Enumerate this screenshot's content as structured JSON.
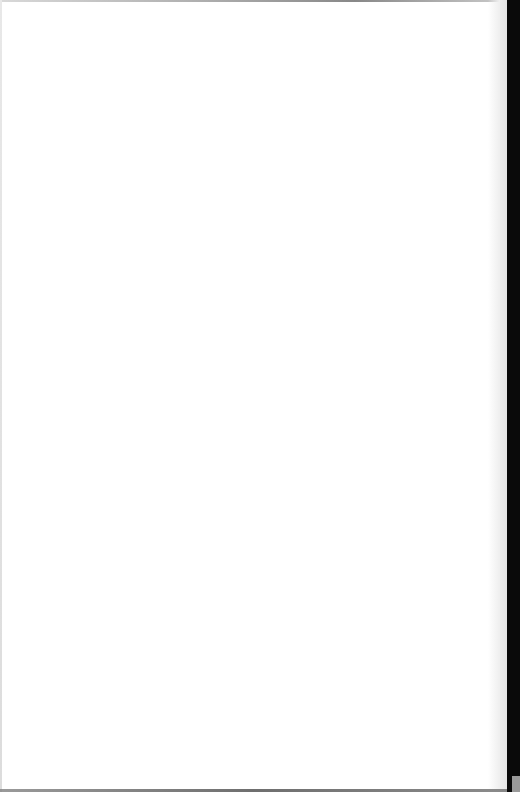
{
  "document": {
    "type": "scanned-page",
    "content": "",
    "colors": {
      "page": "#ffffff",
      "spine": "#0a0a0a",
      "edge": "#6a6a6a"
    }
  }
}
